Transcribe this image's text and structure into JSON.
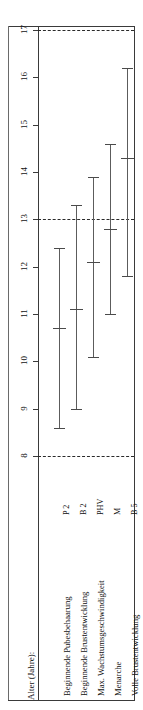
{
  "axis_title": "Alter (Jahre):",
  "chart_data": {
    "type": "bar",
    "orientation": "vertical-ranges",
    "title": "",
    "xlabel": "",
    "ylabel": "Alter (Jahre):",
    "ylim": [
      8,
      17
    ],
    "yticks": [
      8,
      9,
      10,
      11,
      12,
      13,
      14,
      15,
      16,
      17
    ],
    "ytick_labels": [
      "8",
      "9",
      "10",
      "11",
      "12",
      "13",
      "14",
      "15",
      "16",
      "17"
    ],
    "grid": false,
    "reference_lines": [
      8,
      13,
      17
    ],
    "categories": [
      "Beginnende Pubesbehaarung",
      "Beginnende Brustentwicklung",
      "Max. Wachstumsgeschwindigkeit",
      "Menarche",
      "Volle Brustentwicklung"
    ],
    "abbreviations": [
      "P 2",
      "B 2",
      "PHV",
      "M",
      "B 5"
    ],
    "series": [
      {
        "name": "Altersbereich",
        "points": [
          {
            "category": "Beginnende Pubesbehaarung",
            "abbr": "P 2",
            "low": 8.6,
            "mid": 10.7,
            "high": 12.4
          },
          {
            "category": "Beginnende Brustentwicklung",
            "abbr": "B 2",
            "low": 9.0,
            "mid": 11.1,
            "high": 13.3
          },
          {
            "category": "Max. Wachstumsgeschwindigkeit",
            "abbr": "PHV",
            "low": 10.1,
            "mid": 12.1,
            "high": 13.9
          },
          {
            "category": "Menarche",
            "abbr": "M",
            "low": 11.0,
            "mid": 12.8,
            "high": 14.6
          },
          {
            "category": "Volle Brustentwicklung",
            "abbr": "B 5",
            "low": 11.8,
            "mid": 14.3,
            "high": 16.2
          }
        ]
      }
    ]
  }
}
